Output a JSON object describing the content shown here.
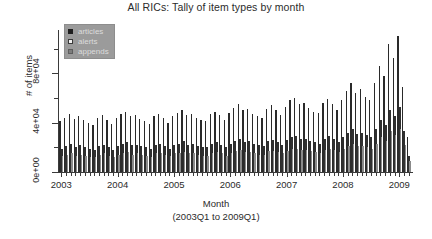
{
  "chart_data": {
    "type": "bar",
    "title": "All RICs: Tally of item types by month",
    "xlabel": "Month",
    "xlabel_sub": "(2003Q1 to 2009Q1)",
    "ylabel": "# of items",
    "grid": false,
    "legend_position": "top-left",
    "ylim": [
      0,
      115000
    ],
    "ytick_values": [
      0,
      20000,
      40000,
      60000,
      80000,
      100000
    ],
    "ytick_labels": [
      "0e+00",
      "",
      "4e+04",
      "",
      "8e+04",
      ""
    ],
    "ytick_labeled": [
      true,
      false,
      true,
      false,
      true,
      false
    ],
    "xtick_labels": [
      "2003",
      "2004",
      "2005",
      "2006",
      "2007",
      "2008",
      "2009"
    ],
    "x_axis_range": "2003Q1 to 2009Q1",
    "n_months": 75,
    "categories": [
      "2003-01",
      "2003-02",
      "2003-03",
      "2003-04",
      "2003-05",
      "2003-06",
      "2003-07",
      "2003-08",
      "2003-09",
      "2003-10",
      "2003-11",
      "2003-12",
      "2004-01",
      "2004-02",
      "2004-03",
      "2004-04",
      "2004-05",
      "2004-06",
      "2004-07",
      "2004-08",
      "2004-09",
      "2004-10",
      "2004-11",
      "2004-12",
      "2005-01",
      "2005-02",
      "2005-03",
      "2005-04",
      "2005-05",
      "2005-06",
      "2005-07",
      "2005-08",
      "2005-09",
      "2005-10",
      "2005-11",
      "2005-12",
      "2006-01",
      "2006-02",
      "2006-03",
      "2006-04",
      "2006-05",
      "2006-06",
      "2006-07",
      "2006-08",
      "2006-09",
      "2006-10",
      "2006-11",
      "2006-12",
      "2007-01",
      "2007-02",
      "2007-03",
      "2007-04",
      "2007-05",
      "2007-06",
      "2007-07",
      "2007-08",
      "2007-09",
      "2007-10",
      "2007-11",
      "2007-12",
      "2008-01",
      "2008-02",
      "2008-03",
      "2008-04",
      "2008-05",
      "2008-06",
      "2008-07",
      "2008-08",
      "2008-09",
      "2008-10",
      "2008-11",
      "2008-12",
      "2009-01",
      "2009-02",
      "2009-03"
    ],
    "series": [
      {
        "name": "articles",
        "color": "#2a2a2a",
        "values": [
          41000,
          44000,
          47000,
          43000,
          45000,
          42000,
          40000,
          38000,
          44000,
          46000,
          42000,
          39000,
          44000,
          47000,
          49000,
          45000,
          46000,
          43000,
          41000,
          39000,
          45000,
          47000,
          44000,
          40000,
          45000,
          48000,
          50000,
          46000,
          47000,
          44000,
          42000,
          41000,
          47000,
          49000,
          46000,
          42000,
          48000,
          52000,
          55000,
          50000,
          51000,
          47000,
          45000,
          44000,
          51000,
          54000,
          50000,
          46000,
          53000,
          58000,
          60000,
          55000,
          56000,
          52000,
          49000,
          48000,
          56000,
          59000,
          55000,
          50000,
          58000,
          66000,
          72000,
          64000,
          67000,
          61000,
          58000,
          72000,
          86000,
          78000,
          104000,
          92000,
          110000,
          69000,
          28000
        ]
      },
      {
        "name": "alerts",
        "color": "#ffffff",
        "values": [
          19000,
          21000,
          23000,
          20000,
          22000,
          20000,
          19000,
          18000,
          21000,
          22000,
          20000,
          18000,
          21000,
          23000,
          24000,
          22000,
          22000,
          21000,
          20000,
          19000,
          22000,
          23000,
          21000,
          19000,
          22000,
          23000,
          25000,
          22000,
          23000,
          21000,
          20000,
          20000,
          23000,
          24000,
          22000,
          20000,
          23000,
          25000,
          27000,
          24000,
          25000,
          23000,
          22000,
          21000,
          25000,
          26000,
          24000,
          22000,
          26000,
          28000,
          29000,
          27000,
          27000,
          25000,
          24000,
          23000,
          27000,
          29000,
          27000,
          24000,
          28000,
          32000,
          35000,
          31000,
          32000,
          30000,
          28000,
          35000,
          42000,
          38000,
          50000,
          45000,
          53000,
          33000,
          13000
        ]
      },
      {
        "name": "appends",
        "color": "#8a8a8a",
        "values": [
          13000,
          14000,
          15000,
          13000,
          14000,
          13000,
          12000,
          12000,
          14000,
          15000,
          13000,
          12000,
          14000,
          15000,
          16000,
          14000,
          15000,
          14000,
          13000,
          12000,
          15000,
          15000,
          14000,
          13000,
          15000,
          15000,
          16000,
          15000,
          15000,
          14000,
          13000,
          13000,
          15000,
          16000,
          15000,
          13000,
          15000,
          17000,
          18000,
          16000,
          16000,
          15000,
          14000,
          14000,
          17000,
          17000,
          16000,
          15000,
          17000,
          19000,
          19000,
          18000,
          18000,
          17000,
          16000,
          15000,
          18000,
          19000,
          18000,
          16000,
          19000,
          21000,
          23000,
          21000,
          21000,
          20000,
          19000,
          23000,
          28000,
          25000,
          33000,
          30000,
          35000,
          22000,
          9000
        ]
      }
    ]
  },
  "legend": {
    "items": [
      {
        "label": "articles",
        "swatch": "filled-dark-square"
      },
      {
        "label": "alerts",
        "swatch": "open-square"
      },
      {
        "label": "appends",
        "swatch": "filled-gray-square"
      }
    ]
  }
}
